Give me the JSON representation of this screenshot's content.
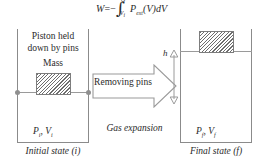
{
  "diagram": {
    "equation": {
      "lhs": "W",
      "equals": "=",
      "sign": "−",
      "integral_glyph": "∫",
      "upper_limit": "V",
      "upper_limit_sub": "f",
      "lower_limit": "V",
      "lower_limit_sub": "i",
      "integrand_p": "P",
      "integrand_p_sub": "ext",
      "integrand_tail": "(V)dV",
      "full_text": "W = -∫(Vi to Vf) Pext(V)dV"
    },
    "left_vessel": {
      "note_line1": "Piston held",
      "note_line2": "down by pins",
      "mass_label": "Mass",
      "state_label_p": "P",
      "state_label_p_sub": "i",
      "state_label_sep": ", ",
      "state_label_v": "V",
      "state_label_v_sub": "i",
      "caption": "Initial state (i)",
      "pin_left_name": "pin-left",
      "pin_right_name": "pin-right"
    },
    "middle": {
      "arrow_label": "Removing pins",
      "process_caption": "Gas expansion"
    },
    "right_vessel": {
      "height_label": "h",
      "state_label_p": "P",
      "state_label_p_sub": "f",
      "state_label_sep": ", ",
      "state_label_v": "V",
      "state_label_v_sub": "f",
      "caption": "Final state (f)"
    },
    "colors": {
      "stroke": "#8b8b8b",
      "hatch": "#6e6e6e",
      "text": "#2a2a2a",
      "background": "#ffffff"
    }
  }
}
